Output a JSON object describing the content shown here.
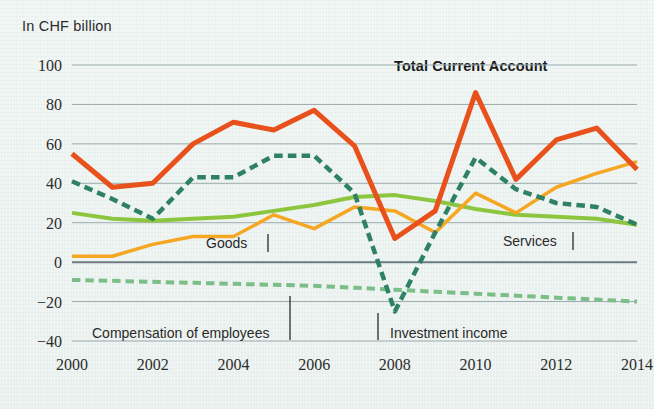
{
  "unit_label": "In CHF billion",
  "chart_title": "Total Current Account",
  "annotations": {
    "goods": "Goods",
    "services": "Services",
    "compensation": "Compensation of employees",
    "investment": "Investment income"
  },
  "colors": {
    "total_current_account": "#E8511C",
    "investment_income": "#2E8164",
    "services": "#8CC63F",
    "goods": "#F5A623",
    "compensation_of_employees": "#7BBE87",
    "gridline": "#9aa9ad",
    "zeroline": "#6d7b80",
    "text": "#2c2c2c",
    "background": "#eef4f2"
  },
  "chart_data": {
    "type": "line",
    "title": "Total Current Account",
    "xlabel": "",
    "ylabel": "In CHF billion",
    "ylim": [
      -40,
      100
    ],
    "xlim": [
      2000,
      2014
    ],
    "grid": true,
    "legend": "inline-annotations",
    "y_ticks": [
      100,
      80,
      60,
      40,
      20,
      0,
      -20,
      -40
    ],
    "y_tick_labels": [
      "100",
      "80",
      "60",
      "40",
      "20",
      "0",
      "−20",
      "−40"
    ],
    "x_ticks": [
      2000,
      2002,
      2004,
      2006,
      2008,
      2010,
      2012,
      2014
    ],
    "x_tick_labels": [
      "2000",
      "2002",
      "2004",
      "2006",
      "2008",
      "2010",
      "2012",
      "2014"
    ],
    "x": [
      2000,
      2001,
      2002,
      2003,
      2004,
      2005,
      2006,
      2007,
      2008,
      2009,
      2010,
      2011,
      2012,
      2013,
      2014
    ],
    "series": [
      {
        "name": "Total Current Account",
        "color": "#E8511C",
        "style": "solid",
        "width": 5,
        "values": [
          55,
          38,
          40,
          60,
          71,
          67,
          77,
          59,
          12,
          26,
          86,
          42,
          62,
          68,
          47
        ]
      },
      {
        "name": "Investment income",
        "color": "#2E8164",
        "style": "dashed",
        "width": 4.5,
        "values": [
          41,
          32,
          22,
          43,
          43,
          54,
          54,
          35,
          -25,
          15,
          53,
          37,
          30,
          28,
          19
        ]
      },
      {
        "name": "Services",
        "color": "#8CC63F",
        "style": "solid",
        "width": 4,
        "values": [
          25,
          22,
          21,
          22,
          23,
          26,
          29,
          33,
          34,
          31,
          27,
          24,
          23,
          22,
          19
        ]
      },
      {
        "name": "Goods",
        "color": "#F5A623",
        "style": "solid",
        "width": 3.5,
        "values": [
          3,
          3,
          9,
          13,
          13,
          24,
          17,
          28,
          26,
          15,
          35,
          25,
          38,
          45,
          51
        ]
      },
      {
        "name": "Compensation of employees",
        "color": "#7BBE87",
        "style": "dashed",
        "width": 4,
        "values": [
          -9,
          -9.5,
          -10,
          -10.5,
          -11,
          -11.5,
          -12,
          -13,
          -14,
          -15,
          -16,
          -17,
          -18,
          -19,
          -20
        ]
      }
    ]
  }
}
